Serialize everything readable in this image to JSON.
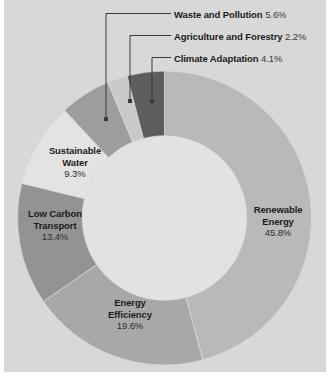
{
  "background": {
    "page": "#ffffff",
    "plot_area": "#d8d8d6"
  },
  "chart_data": {
    "type": "pie",
    "variant": "donut",
    "title": "",
    "subtitle": "",
    "xlabel": "",
    "ylabel": "",
    "legend_position": "none",
    "grid": false,
    "units": "percent",
    "start_angle_deg": 0,
    "direction": "clockwise",
    "inner_radius_ratio": 0.56,
    "categories": [
      "Renewable Energy",
      "Energy Efficiency",
      "Low Carbon Transport",
      "Sustainable Water",
      "Waste and Pollution",
      "Agriculture and Forestry",
      "Climate Adaptation"
    ],
    "values": [
      45.8,
      19.6,
      13.4,
      9.3,
      5.6,
      2.2,
      4.1
    ],
    "value_labels": [
      "45.8%",
      "19.6%",
      "13.4%",
      "9.3%",
      "5.6%",
      "2.2%",
      "4.1%"
    ],
    "colors": [
      "#b9b9b7",
      "#a8a8a6",
      "#939391",
      "#e3e3e1",
      "#9d9d9b",
      "#c9c9c7",
      "#5d5d5b"
    ],
    "slices": [
      {
        "name": "Renewable Energy",
        "value": 45.8,
        "value_label": "45.8%",
        "color": "#b9b9b7",
        "label_mode": "inside",
        "label_lines": [
          "Renewable",
          "Energy",
          "45.8%"
        ]
      },
      {
        "name": "Energy Efficiency",
        "value": 19.6,
        "value_label": "19.6%",
        "color": "#a8a8a6",
        "label_mode": "inside",
        "label_lines": [
          "Energy",
          "Efficiency",
          "19.6%"
        ]
      },
      {
        "name": "Low Carbon Transport",
        "value": 13.4,
        "value_label": "13.4%",
        "color": "#939391",
        "label_mode": "inside",
        "label_lines": [
          "Low Carbon",
          "Transport",
          "13.4%"
        ]
      },
      {
        "name": "Sustainable Water",
        "value": 9.3,
        "value_label": "9.3%",
        "color": "#e3e3e1",
        "label_mode": "inside",
        "label_lines": [
          "Sustainable",
          "Water",
          "9.3%"
        ]
      },
      {
        "name": "Waste and Pollution",
        "value": 5.6,
        "value_label": "5.6%",
        "color": "#9d9d9b",
        "label_mode": "callout",
        "label_lines": [
          "Waste and Pollution"
        ]
      },
      {
        "name": "Agriculture and Forestry",
        "value": 2.2,
        "value_label": "2.2%",
        "color": "#c9c9c7",
        "label_mode": "callout",
        "label_lines": [
          "Agriculture and Forestry"
        ]
      },
      {
        "name": "Climate Adaptation",
        "value": 4.1,
        "value_label": "4.1%",
        "color": "#5d5d5b",
        "label_mode": "callout",
        "label_lines": [
          "Climate Adaptation"
        ]
      }
    ]
  },
  "callouts": [
    {
      "name": "Waste and Pollution",
      "value_label": "5.6%"
    },
    {
      "name": "Agriculture and Forestry",
      "value_label": "2.2%"
    },
    {
      "name": "Climate Adaptation",
      "value_label": "4.1%"
    }
  ],
  "inline_labels": [
    {
      "l1": "Sustainable",
      "l2": "Water",
      "l3": "9.3%"
    },
    {
      "l1": "Low Carbon",
      "l2": "Transport",
      "l3": "13.4%"
    },
    {
      "l1": "Energy",
      "l2": "Efficiency",
      "l3": "19.6%"
    },
    {
      "l1": "Renewable",
      "l2": "Energy",
      "l3": "45.8%"
    }
  ]
}
